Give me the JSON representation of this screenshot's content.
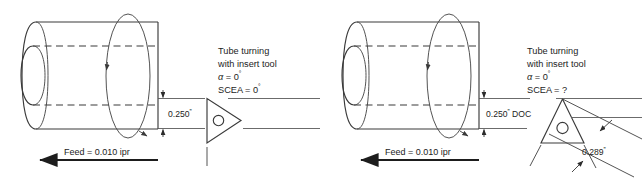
{
  "figure": {
    "background_color": "#ffffff",
    "line_color": "#3a3a3a",
    "text_color": "#1c1c1c"
  },
  "panels": [
    {
      "id": "left",
      "name": "tube-turning-scea-zero",
      "callout": {
        "line1": "Tube turning",
        "line2": "with insert tool",
        "alpha_symbol": "α",
        "alpha_eq": " = 0",
        "alpha_unit": "°",
        "scea_eq": "SCEA = 0",
        "scea_unit": "°"
      },
      "depth_dimension": {
        "label": "0.250",
        "unit": "”"
      },
      "feed": {
        "label": "Feed = 0.010 ipr",
        "direction": "left"
      },
      "insert": {
        "shape": "triangle",
        "orientation": "point-right",
        "has_center-hole": true
      },
      "chip_dimension": null
    },
    {
      "id": "right",
      "name": "tube-turning-scea-unknown",
      "callout": {
        "line1": "Tube turning",
        "line2": "with insert tool",
        "alpha_symbol": "α",
        "alpha_eq": " = 0",
        "alpha_unit": "°",
        "scea_eq": "SCEA = ?",
        "scea_unit": ""
      },
      "depth_dimension": {
        "label": "0.250",
        "unit": "”",
        "suffix": " DOC"
      },
      "feed": {
        "label": "Feed = 0.010 ipr",
        "direction": "left"
      },
      "insert": {
        "shape": "triangle",
        "orientation": "point-up",
        "has_center-hole": true
      },
      "chip_dimension": {
        "label": "0.289",
        "unit": "”"
      }
    }
  ]
}
